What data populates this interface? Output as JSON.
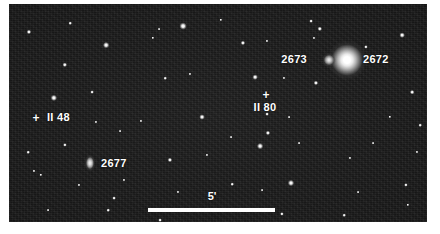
{
  "figure": {
    "kind": "astronomical-finding-chart",
    "background_color": "#ffffff",
    "field_color": "#151515",
    "annotation_color": "#ffffff"
  },
  "labels": [
    {
      "id": "ngc2673",
      "text": "2673",
      "x": 307,
      "y": 59,
      "anchor": "end"
    },
    {
      "id": "ngc2672",
      "text": "2672",
      "x": 363,
      "y": 59,
      "anchor": "start"
    },
    {
      "id": "ii80",
      "text": "II 80",
      "x": 265,
      "y": 107,
      "anchor": "middle"
    },
    {
      "id": "ii48",
      "text": "II 48",
      "x": 47,
      "y": 117,
      "anchor": "start"
    },
    {
      "id": "ngc2677",
      "text": "2677",
      "x": 101,
      "y": 163,
      "anchor": "start"
    }
  ],
  "markers": [
    {
      "id": "marker-ii80",
      "glyph": "+",
      "x": 266,
      "y": 95
    },
    {
      "id": "marker-ii48",
      "glyph": "+",
      "x": 36,
      "y": 118
    }
  ],
  "scale_bar": {
    "label": "5'",
    "label_x": 212,
    "label_y": 196,
    "x_start": 148,
    "x_end": 275,
    "y": 208,
    "thickness": 4,
    "units": "arcminutes",
    "value": 5
  },
  "objects": [
    {
      "id": "ngc2672",
      "name": "2672",
      "type": "galaxy",
      "class": "bright",
      "x": 347,
      "y": 60,
      "w": 44,
      "h": 40
    },
    {
      "id": "ngc2673",
      "name": "2673",
      "type": "galaxy",
      "class": "faint",
      "x": 329,
      "y": 60,
      "w": 15,
      "h": 14
    },
    {
      "id": "ngc2677",
      "name": "2677",
      "type": "galaxy",
      "class": "elong",
      "x": 90,
      "y": 163,
      "w": 11,
      "h": 17
    }
  ],
  "stars": [
    {
      "x": 29,
      "y": 32,
      "r": 2.0
    },
    {
      "x": 70,
      "y": 23,
      "r": 1.4
    },
    {
      "x": 106,
      "y": 45,
      "r": 2.6
    },
    {
      "x": 65,
      "y": 65,
      "r": 2.1
    },
    {
      "x": 54,
      "y": 98,
      "r": 2.8
    },
    {
      "x": 92,
      "y": 92,
      "r": 1.5
    },
    {
      "x": 153,
      "y": 38,
      "r": 1.3
    },
    {
      "x": 183,
      "y": 26,
      "r": 3.0
    },
    {
      "x": 165,
      "y": 78,
      "r": 1.4
    },
    {
      "x": 190,
      "y": 74,
      "r": 1.2
    },
    {
      "x": 159,
      "y": 29,
      "r": 1.1
    },
    {
      "x": 221,
      "y": 20,
      "r": 1.3
    },
    {
      "x": 243,
      "y": 43,
      "r": 2.0
    },
    {
      "x": 267,
      "y": 41,
      "r": 1.2
    },
    {
      "x": 255,
      "y": 77,
      "r": 2.2
    },
    {
      "x": 284,
      "y": 78,
      "r": 1.2
    },
    {
      "x": 289,
      "y": 117,
      "r": 1.1
    },
    {
      "x": 314,
      "y": 38,
      "r": 1.2
    },
    {
      "x": 320,
      "y": 29,
      "r": 2.1
    },
    {
      "x": 366,
      "y": 47,
      "r": 1.6
    },
    {
      "x": 316,
      "y": 83,
      "r": 2.0
    },
    {
      "x": 311,
      "y": 21,
      "r": 1.5
    },
    {
      "x": 402,
      "y": 35,
      "r": 2.2
    },
    {
      "x": 412,
      "y": 92,
      "r": 1.8
    },
    {
      "x": 390,
      "y": 117,
      "r": 1.3
    },
    {
      "x": 267,
      "y": 114,
      "r": 1.5
    },
    {
      "x": 268,
      "y": 133,
      "r": 2.0
    },
    {
      "x": 202,
      "y": 117,
      "r": 2.3
    },
    {
      "x": 141,
      "y": 121,
      "r": 1.2
    },
    {
      "x": 65,
      "y": 145,
      "r": 1.6
    },
    {
      "x": 28,
      "y": 152,
      "r": 1.4
    },
    {
      "x": 41,
      "y": 175,
      "r": 1.3
    },
    {
      "x": 34,
      "y": 171,
      "r": 1.2
    },
    {
      "x": 79,
      "y": 185,
      "r": 1.2
    },
    {
      "x": 114,
      "y": 198,
      "r": 1.5
    },
    {
      "x": 108,
      "y": 210,
      "r": 1.4
    },
    {
      "x": 124,
      "y": 180,
      "r": 1.2
    },
    {
      "x": 170,
      "y": 160,
      "r": 2.0
    },
    {
      "x": 178,
      "y": 192,
      "r": 1.2
    },
    {
      "x": 160,
      "y": 220,
      "r": 1.5
    },
    {
      "x": 232,
      "y": 184,
      "r": 1.4
    },
    {
      "x": 260,
      "y": 146,
      "r": 2.6
    },
    {
      "x": 262,
      "y": 190,
      "r": 1.1
    },
    {
      "x": 282,
      "y": 214,
      "r": 1.6
    },
    {
      "x": 291,
      "y": 183,
      "r": 2.7
    },
    {
      "x": 299,
      "y": 143,
      "r": 1.1
    },
    {
      "x": 344,
      "y": 215,
      "r": 1.4
    },
    {
      "x": 350,
      "y": 158,
      "r": 1.2
    },
    {
      "x": 358,
      "y": 192,
      "r": 1.1
    },
    {
      "x": 406,
      "y": 185,
      "r": 1.6
    },
    {
      "x": 417,
      "y": 152,
      "r": 1.2
    },
    {
      "x": 420,
      "y": 125,
      "r": 1.4
    },
    {
      "x": 408,
      "y": 205,
      "r": 1.3
    },
    {
      "x": 373,
      "y": 143,
      "r": 1.1
    },
    {
      "x": 231,
      "y": 137,
      "r": 1.1
    },
    {
      "x": 120,
      "y": 131,
      "r": 1.1
    },
    {
      "x": 96,
      "y": 122,
      "r": 1.2
    },
    {
      "x": 207,
      "y": 155,
      "r": 1.2
    },
    {
      "x": 48,
      "y": 210,
      "r": 1.1
    },
    {
      "x": 196,
      "y": 209,
      "r": 1.1
    }
  ]
}
